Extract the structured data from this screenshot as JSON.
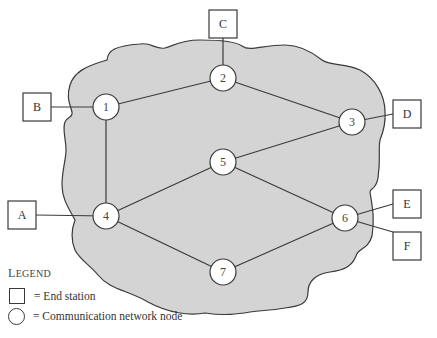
{
  "diagram": {
    "type": "network",
    "colors": {
      "cloud_fill": "#d4d4d4",
      "stroke": "#3a3a3a",
      "node_fill": "#ffffff"
    },
    "nodes": [
      {
        "id": "1",
        "label": "1",
        "x": 106,
        "y": 107
      },
      {
        "id": "2",
        "label": "2",
        "x": 223,
        "y": 78
      },
      {
        "id": "3",
        "label": "3",
        "x": 352,
        "y": 122
      },
      {
        "id": "4",
        "label": "4",
        "x": 106,
        "y": 216
      },
      {
        "id": "5",
        "label": "5",
        "x": 223,
        "y": 162
      },
      {
        "id": "6",
        "label": "6",
        "x": 345,
        "y": 218
      },
      {
        "id": "7",
        "label": "7",
        "x": 223,
        "y": 272
      }
    ],
    "stations": [
      {
        "id": "A",
        "label": "A",
        "x": 8,
        "y": 201,
        "attached_to": "4"
      },
      {
        "id": "B",
        "label": "B",
        "x": 23,
        "y": 93,
        "attached_to": "1"
      },
      {
        "id": "C",
        "label": "C",
        "x": 209,
        "y": 10,
        "attached_to": "2"
      },
      {
        "id": "D",
        "label": "D",
        "x": 393,
        "y": 100,
        "attached_to": "3"
      },
      {
        "id": "E",
        "label": "E",
        "x": 393,
        "y": 190,
        "attached_to": "6"
      },
      {
        "id": "F",
        "label": "F",
        "x": 393,
        "y": 232,
        "attached_to": "6"
      }
    ],
    "links": [
      [
        "1",
        "2"
      ],
      [
        "1",
        "4"
      ],
      [
        "2",
        "3"
      ],
      [
        "3",
        "5"
      ],
      [
        "4",
        "5"
      ],
      [
        "4",
        "7"
      ],
      [
        "5",
        "6"
      ],
      [
        "6",
        "7"
      ]
    ]
  },
  "legend": {
    "title_first": "L",
    "title_rest": "EGEND",
    "items": [
      {
        "symbol": "square",
        "text": "= End station"
      },
      {
        "symbol": "circle",
        "text": "= Communication network node"
      }
    ]
  }
}
